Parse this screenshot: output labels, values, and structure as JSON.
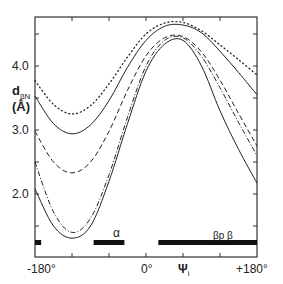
{
  "chart_data": {
    "type": "line",
    "title": "",
    "xlabel": "Ψi",
    "ylabel": "dβN (Å)",
    "xlim": [
      -180,
      180
    ],
    "ylim": [
      1.0,
      4.75
    ],
    "grid": false,
    "legend": null,
    "x_tick_labels": [
      "-180°",
      "0°",
      "+180°"
    ],
    "x_ticks": [
      -180,
      -120,
      -60,
      0,
      60,
      120,
      180
    ],
    "y_tick_labels": [
      "2.0",
      "3.0",
      "4.0"
    ],
    "y_ticks": [
      1.5,
      2.0,
      2.5,
      3.0,
      3.5,
      4.0,
      4.5
    ],
    "x": [
      -180,
      -150,
      -120,
      -90,
      -60,
      -30,
      0,
      30,
      60,
      90,
      120,
      150,
      180
    ],
    "series": [
      {
        "name": "dotted",
        "style": "dotted",
        "values": [
          3.77,
          3.4,
          3.25,
          3.38,
          3.72,
          4.14,
          4.5,
          4.67,
          4.68,
          4.55,
          4.33,
          4.1,
          3.86
        ]
      },
      {
        "name": "solid-upper",
        "style": "solid",
        "values": [
          3.53,
          3.1,
          2.94,
          3.08,
          3.46,
          3.98,
          4.4,
          4.62,
          4.64,
          4.52,
          4.23,
          3.9,
          3.55
        ]
      },
      {
        "name": "dashed",
        "style": "dashed",
        "values": [
          2.98,
          2.5,
          2.33,
          2.5,
          2.98,
          3.62,
          4.16,
          4.44,
          4.46,
          4.22,
          3.78,
          3.26,
          2.75
        ]
      },
      {
        "name": "dash-dot",
        "style": "dashdot",
        "values": [
          2.5,
          1.72,
          1.4,
          1.62,
          2.3,
          3.2,
          4.0,
          4.4,
          4.44,
          4.15,
          3.66,
          3.12,
          2.6
        ]
      },
      {
        "name": "solid-lower",
        "style": "solid",
        "values": [
          2.08,
          1.5,
          1.31,
          1.5,
          2.2,
          3.1,
          3.92,
          4.34,
          4.4,
          4.0,
          3.3,
          2.7,
          2.17
        ]
      }
    ],
    "annotations": [
      {
        "text": "α",
        "x_range": [
          -85,
          -35
        ]
      },
      {
        "text": "βp β",
        "x_range": [
          20,
          180
        ]
      },
      {
        "text": "",
        "x_range": [
          -180,
          -170
        ]
      }
    ]
  },
  "labels": {
    "y_4": "4.0",
    "y_3": "3.0",
    "y_2": "2.0",
    "ylabel_main": "d",
    "ylabel_sub": "βN",
    "ylabel_unit": "(Å)",
    "x_left": "-180°",
    "x_mid": "0°",
    "x_var": "Ψ",
    "x_var_sub": "i",
    "x_right": "+180°",
    "alpha": "α",
    "beta": "βp β"
  }
}
